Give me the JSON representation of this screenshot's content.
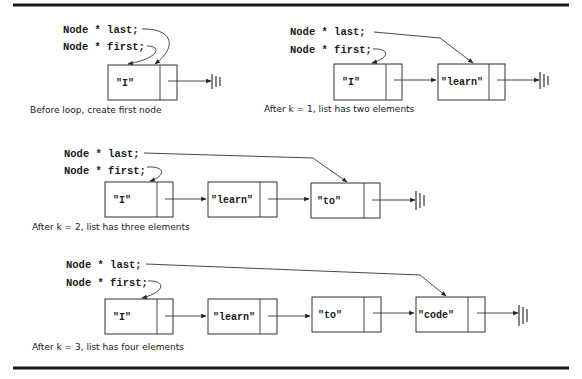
{
  "figure": {
    "rules": {
      "top_y": 5,
      "bottom_y": 368,
      "x1": 13,
      "x2": 569
    },
    "declarations": {
      "last": "Node * last;",
      "first": "Node * first;"
    },
    "stages": [
      {
        "id": "stage-0",
        "caption": "Before loop, create first node",
        "nodes": [
          "\"I\""
        ],
        "first_points_to": "\"I\"",
        "last_points_to": "\"I\""
      },
      {
        "id": "stage-1",
        "caption": "After k = 1, list has two elements",
        "nodes": [
          "\"I\"",
          "\"learn\""
        ],
        "first_points_to": "\"I\"",
        "last_points_to": "\"learn\""
      },
      {
        "id": "stage-2",
        "caption": "After k = 2, list has three elements",
        "nodes": [
          "\"I\"",
          "\"learn\"",
          "\"to\""
        ],
        "first_points_to": "\"I\"",
        "last_points_to": "\"to\""
      },
      {
        "id": "stage-3",
        "caption": "After k = 3, list has four elements",
        "nodes": [
          "\"I\"",
          "\"learn\"",
          "\"to\"",
          "\"code\""
        ],
        "first_points_to": "\"I\"",
        "last_points_to": "\"code\""
      }
    ],
    "terminator_icon": "null-ground-icon",
    "colors": {
      "ink": "#333333",
      "background": "#ffffff"
    }
  }
}
